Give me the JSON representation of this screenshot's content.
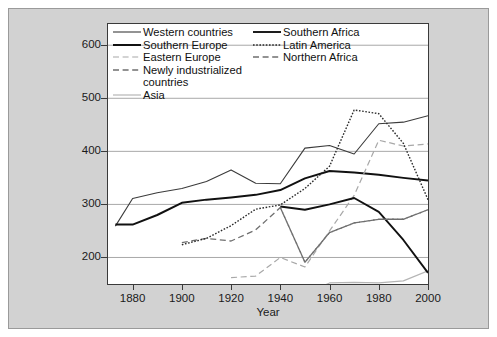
{
  "chart_data": {
    "type": "line",
    "title": "",
    "xlabel": "Year",
    "ylabel": "",
    "xlim": [
      1870,
      2000
    ],
    "ylim": [
      150,
      640
    ],
    "grid": "horizontal",
    "legend_position": "top-left-inside",
    "xticks": [
      1880,
      1900,
      1920,
      1940,
      1960,
      1980,
      2000
    ],
    "yticks": [
      200,
      300,
      400,
      500,
      600
    ],
    "series": [
      {
        "name": "Western countries",
        "style": "solid",
        "color": "#3b3b3b",
        "width": 1.1,
        "x": [
          1873,
          1880,
          1890,
          1900,
          1910,
          1920,
          1930,
          1940,
          1950,
          1960,
          1970,
          1980,
          1990,
          2000
        ],
        "y": [
          259,
          311,
          322,
          330,
          343,
          365,
          340,
          339,
          406,
          411,
          395,
          452,
          455,
          467
        ]
      },
      {
        "name": "Southern Europe",
        "style": "solid",
        "color": "#111111",
        "width": 2.0,
        "x": [
          1873,
          1880,
          1890,
          1900,
          1910,
          1920,
          1930,
          1940,
          1950,
          1960,
          1970,
          1980,
          1990,
          2000
        ],
        "y": [
          262,
          262,
          280,
          303,
          309,
          313,
          318,
          327,
          349,
          363,
          360,
          356,
          350,
          345
        ]
      },
      {
        "name": "Eastern Europe",
        "style": "dashed-light",
        "color": "#a8a8a8",
        "width": 1.2,
        "x": [
          1920,
          1930,
          1940,
          1950,
          1960,
          1970,
          1980,
          1990,
          2000
        ],
        "y": [
          162,
          165,
          200,
          182,
          250,
          317,
          421,
          410,
          414
        ]
      },
      {
        "name": "Newly industrialized countries",
        "style": "dashed",
        "color": "#6f6f6f",
        "width": 1.3,
        "x": [
          1900,
          1910,
          1920,
          1930,
          1940,
          1950,
          1960,
          1970,
          1980,
          1990,
          2000
        ],
        "y": [
          228,
          236,
          231,
          252,
          294,
          191,
          247,
          265,
          272,
          272,
          290
        ]
      },
      {
        "name": "Asia",
        "style": "solid-light",
        "color": "#b5b5b5",
        "width": 1.2,
        "x": [
          1950,
          1960,
          1970,
          1980,
          1990,
          2000
        ],
        "y": [
          130,
          152,
          153,
          152,
          156,
          175
        ]
      },
      {
        "name": "Southern Africa",
        "style": "solid",
        "color": "#111111",
        "width": 1.9,
        "x": [
          1940,
          1950,
          1960,
          1970,
          1980,
          1990,
          2000
        ],
        "y": [
          296,
          290,
          300,
          312,
          286,
          233,
          171
        ]
      },
      {
        "name": "Latin America",
        "style": "dotted",
        "color": "#2a2a2a",
        "width": 1.4,
        "x": [
          1900,
          1910,
          1920,
          1930,
          1940,
          1950,
          1960,
          1970,
          1980,
          1990,
          2000
        ],
        "y": [
          224,
          236,
          260,
          291,
          299,
          330,
          372,
          478,
          471,
          415,
          309
        ]
      },
      {
        "name": "Northern Africa",
        "style": "dashed",
        "color": "#6f6f6f",
        "width": 1.3,
        "x": [
          1940,
          1950,
          1960,
          1970,
          1980,
          1990,
          2000
        ],
        "y": [
          294,
          191,
          247,
          265,
          272,
          272,
          290
        ]
      }
    ]
  },
  "axes": {
    "x_title": "Year",
    "x_tick_labels": [
      "1880",
      "1900",
      "1920",
      "1940",
      "1960",
      "1980",
      "2000"
    ],
    "y_tick_labels": [
      "200",
      "300",
      "400",
      "500",
      "600"
    ]
  },
  "legend": {
    "left_column": [
      {
        "label": "Western countries",
        "series": "Western countries"
      },
      {
        "label": "Southern Europe",
        "series": "Southern Europe"
      },
      {
        "label": "Eastern Europe",
        "series": "Eastern Europe"
      },
      {
        "label": "Newly industrialized\ncountries",
        "series": "Newly industrialized countries"
      },
      {
        "label": "Asia",
        "series": "Asia"
      }
    ],
    "right_column": [
      {
        "label": "Southern Africa",
        "series": "Southern Africa"
      },
      {
        "label": "Latin America",
        "series": "Latin America"
      },
      {
        "label": "Northern Africa",
        "series": "Northern Africa"
      }
    ]
  },
  "colors": {
    "figure_background": "#d2d2d2",
    "plot_background": "#ffffff",
    "grid": "#9e9e9e",
    "axis": "#3a3a3a",
    "text": "#101010"
  }
}
